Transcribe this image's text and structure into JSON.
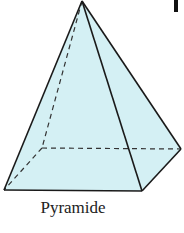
{
  "figure": {
    "label": "Pyramide",
    "fill_color": "#d4f0f4",
    "stroke_color": "#1a1a1a",
    "vertices": {
      "apex": [
        82,
        1
      ],
      "front_left": [
        4,
        190
      ],
      "front_right": [
        142,
        191
      ],
      "back_right": [
        181,
        149
      ],
      "back_left": [
        42,
        148
      ]
    }
  }
}
